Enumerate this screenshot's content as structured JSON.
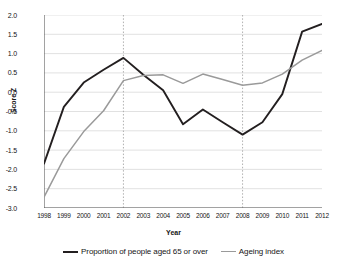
{
  "chart_data": {
    "type": "line",
    "title": "",
    "xlabel": "Year",
    "ylabel": "Score Z",
    "x": [
      1998,
      1999,
      2000,
      2001,
      2002,
      2003,
      2004,
      2005,
      2006,
      2007,
      2008,
      2009,
      2010,
      2011,
      2012
    ],
    "categories": [
      "1998",
      "1999",
      "2000",
      "2001",
      "2002",
      "2003",
      "2004",
      "2005",
      "2006",
      "2007",
      "2008",
      "2009",
      "2010",
      "2011",
      "2012"
    ],
    "series": [
      {
        "name": "Proportion of people aged 65 or over",
        "color": "#231f20",
        "values": [
          -1.85,
          -0.38,
          0.25,
          0.58,
          0.89,
          0.45,
          0.05,
          -0.83,
          -0.45,
          -0.78,
          -1.1,
          -0.78,
          -0.05,
          1.57,
          1.77
        ]
      },
      {
        "name": "Ageing index",
        "color": "#9a9a9a",
        "values": [
          -2.72,
          -1.72,
          -1.02,
          -0.48,
          0.3,
          0.43,
          0.45,
          0.23,
          0.47,
          0.33,
          0.18,
          0.24,
          0.47,
          0.83,
          1.08
        ]
      }
    ],
    "ylim": [
      -3.0,
      2.0
    ],
    "xlim": [
      1998,
      2012
    ],
    "y_ticks": [
      2.0,
      1.5,
      1.0,
      0.5,
      0.0,
      -0.5,
      -1.0,
      -1.5,
      -2.0,
      -2.5,
      -3.0
    ],
    "y_tick_labels": [
      "2.0",
      "1.5",
      "1.0",
      "0.5",
      "0.0",
      "-0.5",
      "-1.0",
      "-1.5",
      "-2.0",
      "-2.5",
      "-3.0"
    ],
    "grid": "horizontal",
    "grid_color": "#d9d9d9",
    "reference_lines": [
      {
        "x": 2002,
        "style": "dotted",
        "color": "#a8a8a8"
      },
      {
        "x": 2008,
        "style": "dotted",
        "color": "#a8a8a8"
      }
    ],
    "legend_position": "bottom",
    "legend": [
      "Proportion of people aged 65 or over",
      "Ageing index"
    ],
    "background": "#ffffff",
    "axis_color": "#555555"
  }
}
